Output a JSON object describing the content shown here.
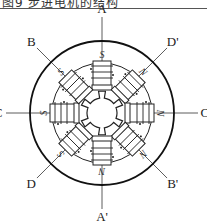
{
  "header": {
    "caption_fragment": "图9 步进电机的结构"
  },
  "diagram": {
    "stator_poles": [
      {
        "id": "A",
        "angle_deg": 0,
        "polarity": "S"
      },
      {
        "id": "D'",
        "angle_deg": 45,
        "polarity": "N"
      },
      {
        "id": "C'",
        "angle_deg": 90,
        "polarity": "N"
      },
      {
        "id": "B'",
        "angle_deg": 135,
        "polarity": "N"
      },
      {
        "id": "A'",
        "angle_deg": 180,
        "polarity": "N"
      },
      {
        "id": "D",
        "angle_deg": 225,
        "polarity": "S"
      },
      {
        "id": "C",
        "angle_deg": 270,
        "polarity": "S"
      },
      {
        "id": "B",
        "angle_deg": 315,
        "polarity": "S"
      }
    ],
    "rotor_teeth": 6,
    "phase_labels": [
      "A",
      "A'",
      "B",
      "B'",
      "C",
      "C'",
      "D",
      "D'"
    ]
  }
}
